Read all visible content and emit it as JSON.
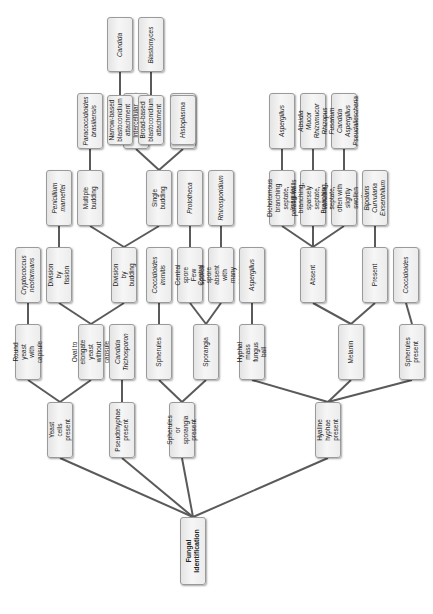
{
  "diagram": {
    "title": "Fungal Identification",
    "orientation": "rotated-90-ccw",
    "nodes": [
      {
        "id": "root",
        "label": "Fungal\nIdentification",
        "x": 193,
        "y": 517,
        "w": 26,
        "h": 68,
        "style": "b"
      },
      {
        "id": "yeast",
        "label": "Yeast cells present",
        "x": 60,
        "y": 402,
        "w": 26,
        "h": 56
      },
      {
        "id": "pseudo",
        "label": "Pseudohyphae\npresent",
        "x": 122,
        "y": 402,
        "w": 26,
        "h": 56
      },
      {
        "id": "spher_spor",
        "label": "Spherules or\nsporangia present",
        "x": 182,
        "y": 402,
        "w": 26,
        "h": 56
      },
      {
        "id": "hyaline",
        "label": "Hyaline hyphae\npresent",
        "x": 328,
        "y": 402,
        "w": 26,
        "h": 56
      },
      {
        "id": "round",
        "label": "Round yeast\nwith capsule",
        "x": 28,
        "y": 324,
        "w": 26,
        "h": 56
      },
      {
        "id": "oval",
        "label": "Oval to elongate\nyeast\nwithout capsule",
        "x": 91,
        "y": 324,
        "w": 26,
        "h": 56
      },
      {
        "id": "candida_tricho",
        "label": "Candida\nTrichosporon",
        "x": 122,
        "y": 324,
        "w": 26,
        "h": 56,
        "style": "it"
      },
      {
        "id": "spherules",
        "label": "Spherules",
        "x": 159,
        "y": 324,
        "w": 26,
        "h": 56
      },
      {
        "id": "sporangia",
        "label": "Sporangia",
        "x": 206,
        "y": 324,
        "w": 26,
        "h": 56
      },
      {
        "id": "hyphal_mass",
        "label": "Hyphal mass\nfungus ball",
        "x": 252,
        "y": 324,
        "w": 26,
        "h": 56
      },
      {
        "id": "melanin",
        "label": "Melanin",
        "x": 351,
        "y": 324,
        "w": 26,
        "h": 56
      },
      {
        "id": "spher_present",
        "label": "Spherules present",
        "x": 412,
        "y": 324,
        "w": 26,
        "h": 56
      },
      {
        "id": "crypto",
        "label": "Cryptococcus\nneoformans",
        "x": 28,
        "y": 247,
        "w": 26,
        "h": 56,
        "style": "it"
      },
      {
        "id": "fission",
        "label": "Division by fission",
        "x": 59,
        "y": 247,
        "w": 26,
        "h": 56
      },
      {
        "id": "budding",
        "label": "Division by budding",
        "x": 124,
        "y": 247,
        "w": 26,
        "h": 56
      },
      {
        "id": "cocci1",
        "label": "Coccidioides\nimmitis",
        "x": 159,
        "y": 247,
        "w": 26,
        "h": 56,
        "style": "it"
      },
      {
        "id": "few_spores",
        "label": "Central spore Few\nspores",
        "x": 190,
        "y": 247,
        "w": 26,
        "h": 56
      },
      {
        "id": "many_spores",
        "label": "Central spore\nabsent with many\nspores",
        "x": 221,
        "y": 247,
        "w": 26,
        "h": 56
      },
      {
        "id": "asp1",
        "label": "Aspergillus",
        "x": 252,
        "y": 247,
        "w": 26,
        "h": 56,
        "style": "it"
      },
      {
        "id": "absent",
        "label": "Absent",
        "x": 313,
        "y": 247,
        "w": 26,
        "h": 56
      },
      {
        "id": "present",
        "label": "Present",
        "x": 375,
        "y": 247,
        "w": 26,
        "h": 56
      },
      {
        "id": "cocci2",
        "label": "Coccidioides",
        "x": 406,
        "y": 247,
        "w": 26,
        "h": 56,
        "style": "it"
      },
      {
        "id": "penicillium",
        "label": "Penicillium\nmarneffei",
        "x": 59,
        "y": 170,
        "w": 26,
        "h": 56,
        "style": "it"
      },
      {
        "id": "multiple",
        "label": "Multiple budding",
        "x": 90,
        "y": 170,
        "w": 26,
        "h": 56
      },
      {
        "id": "single",
        "label": "Single budding",
        "x": 159,
        "y": 170,
        "w": 26,
        "h": 56
      },
      {
        "id": "prototheca",
        "label": "Prototheca",
        "x": 190,
        "y": 170,
        "w": 26,
        "h": 56,
        "style": "it"
      },
      {
        "id": "rhino",
        "label": "Rhinosporidium",
        "x": 221,
        "y": 170,
        "w": 26,
        "h": 56,
        "style": "it"
      },
      {
        "id": "dichot",
        "label": "Dichotomous branching\nseptate, parallel walls",
        "x": 282,
        "y": 170,
        "w": 26,
        "h": 56
      },
      {
        "id": "irregular",
        "label": "Irregular branching,\nsparsely septate,\nvariable\ndiameter",
        "x": 313,
        "y": 170,
        "w": 26,
        "h": 56
      },
      {
        "id": "branching",
        "label": "Branching, septate,\noften with slightly\nswollen cells",
        "x": 344,
        "y": 170,
        "w": 26,
        "h": 56
      },
      {
        "id": "bipolaris",
        "label": "Bipolaris\nCurvularia\nExserohilum",
        "x": 375,
        "y": 170,
        "w": 26,
        "h": 56,
        "style": "it"
      },
      {
        "id": "paracocci",
        "label": "Paracoccidioides\nbrasiliensis",
        "x": 90,
        "y": 93,
        "w": 26,
        "h": 56,
        "style": "it"
      },
      {
        "id": "intercell",
        "label": "Intercellular",
        "x": 136,
        "y": 93,
        "w": 26,
        "h": 56
      },
      {
        "id": "intracell",
        "label": "Intracellular",
        "x": 183,
        "y": 93,
        "w": 26,
        "h": 56
      },
      {
        "id": "asp2",
        "label": "Aspergillus",
        "x": 282,
        "y": 93,
        "w": 26,
        "h": 56,
        "style": "it"
      },
      {
        "id": "absidia",
        "label": "Absidia\nMucor\nRhizomucor\nRhizopus",
        "x": 313,
        "y": 93,
        "w": 26,
        "h": 56,
        "style": "it"
      },
      {
        "id": "cand_asp",
        "label": "Fusarium\nCandida\nAspergillus\nPseudallescheria",
        "x": 344,
        "y": 93,
        "w": 26,
        "h": 56,
        "style": "it"
      },
      {
        "id": "narrow",
        "label": "Narrow-based\nblastoconidium\nattachment",
        "x": 120,
        "y": 95,
        "w": 26,
        "h": 50
      },
      {
        "id": "broad",
        "label": "Broad-based\nblastoconidium\nattachment",
        "x": 151,
        "y": 95,
        "w": 26,
        "h": 50
      },
      {
        "id": "histo",
        "label": "Histoplasma",
        "x": 183,
        "y": 95,
        "w": 26,
        "h": 50,
        "style": "it"
      },
      {
        "id": "candida",
        "label": "Candida",
        "x": 120,
        "y": 17,
        "w": 26,
        "h": 55,
        "style": "it"
      },
      {
        "id": "blasto",
        "label": "Blastomyces",
        "x": 151,
        "y": 17,
        "w": 26,
        "h": 55,
        "style": "it"
      }
    ],
    "edges": [
      [
        "root",
        "yeast"
      ],
      [
        "root",
        "pseudo"
      ],
      [
        "root",
        "spher_spor"
      ],
      [
        "root",
        "hyaline"
      ],
      [
        "yeast",
        "round"
      ],
      [
        "yeast",
        "oval"
      ],
      [
        "pseudo",
        "candida_tricho"
      ],
      [
        "spher_spor",
        "spherules"
      ],
      [
        "spher_spor",
        "sporangia"
      ],
      [
        "hyaline",
        "hyphal_mass"
      ],
      [
        "hyaline",
        "melanin"
      ],
      [
        "hyaline",
        "spher_present"
      ],
      [
        "round",
        "crypto"
      ],
      [
        "oval",
        "fission"
      ],
      [
        "oval",
        "budding"
      ],
      [
        "spherules",
        "cocci1"
      ],
      [
        "sporangia",
        "few_spores"
      ],
      [
        "sporangia",
        "many_spores"
      ],
      [
        "hyphal_mass",
        "asp1"
      ],
      [
        "melanin",
        "absent"
      ],
      [
        "melanin",
        "present"
      ],
      [
        "spher_present",
        "cocci2"
      ],
      [
        "fission",
        "penicillium"
      ],
      [
        "budding",
        "multiple"
      ],
      [
        "budding",
        "single"
      ],
      [
        "few_spores",
        "prototheca"
      ],
      [
        "many_spores",
        "rhino"
      ],
      [
        "absent",
        "dichot"
      ],
      [
        "absent",
        "irregular"
      ],
      [
        "absent",
        "branching"
      ],
      [
        "present",
        "bipolaris"
      ],
      [
        "multiple",
        "paracocci"
      ],
      [
        "single",
        "intercell"
      ],
      [
        "single",
        "intracell"
      ],
      [
        "dichot",
        "asp2"
      ],
      [
        "irregular",
        "absidia"
      ],
      [
        "branching",
        "cand_asp"
      ],
      [
        "intercell",
        "narrow"
      ],
      [
        "intercell",
        "broad"
      ],
      [
        "intracell",
        "histo"
      ],
      [
        "narrow",
        "candida"
      ],
      [
        "broad",
        "blasto"
      ]
    ],
    "colors": {
      "edge": "#5a5a5a",
      "box_border": "#9a9a9a",
      "box_fill": "#eeeeee",
      "text": "#222222"
    }
  }
}
